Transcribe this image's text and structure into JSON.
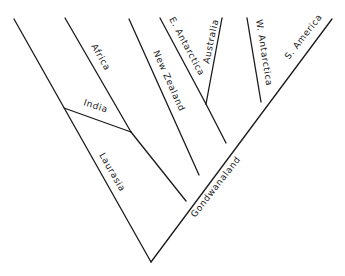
{
  "diagram": {
    "type": "cladogram",
    "labels": {
      "africa": "Africa",
      "india": "India",
      "laurasia": "Laurasia",
      "new_zealand": "New Zealand",
      "e_antarctica": "E. Antarctica",
      "australia": "Australia",
      "w_antarctica": "W. Antarctica",
      "s_america": "S. America",
      "gondwanaland": "Gondwanaland"
    },
    "tree": {
      "root": [
        "Laurasia-lineage",
        "Gondwanaland"
      ],
      "Laurasia-lineage": [
        "Laurasia",
        [
          "India",
          "Africa"
        ]
      ],
      "Gondwanaland": [
        "New Zealand",
        [
          [
            "E. Antarctica",
            "Australia"
          ],
          [
            "W. Antarctica",
            "S. America"
          ]
        ]
      ]
    },
    "line_color": "#1a1a1a",
    "background": "#ffffff"
  }
}
